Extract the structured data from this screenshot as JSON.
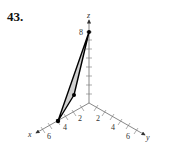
{
  "problem_number": "43.",
  "axes": {
    "z": {
      "label": "z",
      "tick_labels": [
        "8"
      ]
    },
    "x": {
      "label": "x",
      "tick_labels": [
        "2",
        "4",
        "6"
      ]
    },
    "y": {
      "label": "y",
      "tick_labels": [
        "2",
        "4",
        "6"
      ]
    }
  },
  "triangle": {
    "fill": "#d0d0d0",
    "stroke": "#000000",
    "vertices_screen": [
      [
        89,
        32
      ],
      [
        74,
        95
      ],
      [
        58,
        121
      ]
    ]
  }
}
